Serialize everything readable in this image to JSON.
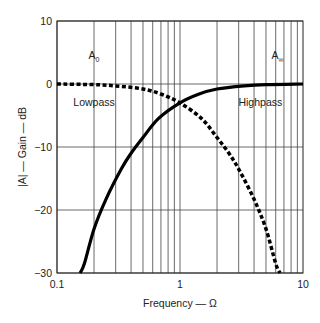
{
  "chart_data": {
    "type": "line",
    "title": "",
    "xlabel": "Frequency — Ω",
    "ylabel": "|A| — Gain — dB",
    "xscale": "log",
    "xlim": [
      0.1,
      10
    ],
    "ylim": [
      -30,
      10
    ],
    "x_ticks": [
      0.1,
      1,
      10
    ],
    "x_tick_labels": [
      "0.1",
      "1",
      "10"
    ],
    "y_ticks": [
      10,
      0,
      -10,
      -20,
      -30
    ],
    "y_tick_labels": [
      "10",
      "0",
      "−10",
      "−20",
      "−30"
    ],
    "grid": true,
    "legend": "none",
    "series": [
      {
        "name": "Lowpass",
        "style": "dashed",
        "x": [
          0.1,
          0.2,
          0.3,
          0.5,
          0.7,
          1,
          1.5,
          2,
          2.5,
          3,
          4,
          5,
          6,
          6.5
        ],
        "y": [
          0,
          -0.1,
          -0.3,
          -0.8,
          -1.6,
          -3,
          -5.5,
          -8.5,
          -11,
          -13.5,
          -18.3,
          -23,
          -28.5,
          -30
        ]
      },
      {
        "name": "Highpass",
        "style": "solid",
        "x": [
          0.154,
          0.167,
          0.2,
          0.25,
          0.333,
          0.4,
          0.5,
          0.667,
          1,
          1.43,
          2,
          3.33,
          5,
          10
        ],
        "y": [
          -30,
          -28.5,
          -23,
          -18.3,
          -13.5,
          -11,
          -8.5,
          -5.5,
          -3,
          -1.6,
          -0.8,
          -0.3,
          -0.1,
          0
        ]
      }
    ],
    "annotations": [
      {
        "text": "A",
        "sub": "0",
        "x": 0.2,
        "y": 4
      },
      {
        "text": "A",
        "sub": "∞",
        "x": 6.2,
        "y": 4
      },
      {
        "text": "Lowpass",
        "x": 0.2,
        "y": -3.5
      },
      {
        "text": "Highpass",
        "x": 4.5,
        "y": -3.5
      }
    ]
  }
}
